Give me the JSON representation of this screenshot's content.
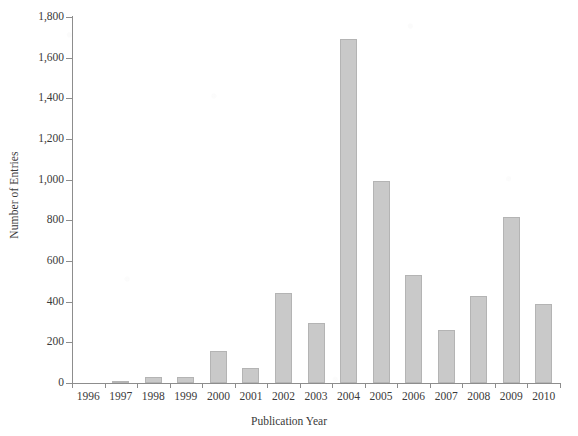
{
  "chart_data": {
    "type": "bar",
    "title": "",
    "xlabel": "Publication Year",
    "ylabel": "Number of Entries",
    "categories": [
      "1996",
      "1997",
      "1998",
      "1999",
      "2000",
      "2001",
      "2002",
      "2003",
      "2004",
      "2005",
      "2006",
      "2007",
      "2008",
      "2009",
      "2010"
    ],
    "values": [
      0,
      5,
      30,
      30,
      155,
      75,
      445,
      295,
      1690,
      995,
      530,
      260,
      430,
      815,
      390
    ],
    "series": [
      {
        "name": "Number of Entries",
        "values": [
          0,
          5,
          30,
          30,
          155,
          75,
          445,
          295,
          1690,
          995,
          530,
          260,
          430,
          815,
          390
        ]
      }
    ],
    "ylim": [
      0,
      1800
    ],
    "ytick_values": [
      0,
      200,
      400,
      600,
      800,
      1000,
      1200,
      1400,
      1600,
      1800
    ],
    "ytick_labels": [
      "0",
      "200",
      "400",
      "600",
      "800",
      "1,000",
      "1,200",
      "1,400",
      "1,600",
      "1,800"
    ],
    "grid": false,
    "legend": "none",
    "bar_color": "#c9c9c9",
    "bar_edge_color": "#b4b4b4",
    "axis_color": "#8d8d8d",
    "text_color": "#3a3a3a",
    "background_color": "#ffffff"
  }
}
